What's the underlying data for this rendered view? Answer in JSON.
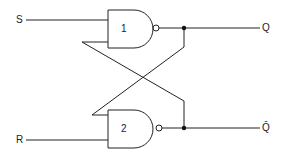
{
  "diagram": {
    "type": "SR latch (cross-coupled NAND gates)",
    "inputs": [
      {
        "label": "S"
      },
      {
        "label": "R"
      }
    ],
    "gates": [
      {
        "label": "1",
        "kind": "NAND"
      },
      {
        "label": "2",
        "kind": "NAND"
      }
    ],
    "outputs": [
      {
        "label": "Q"
      },
      {
        "label": "Q̄"
      }
    ],
    "colors": {
      "line": "#222222",
      "background": "#ffffff"
    }
  }
}
